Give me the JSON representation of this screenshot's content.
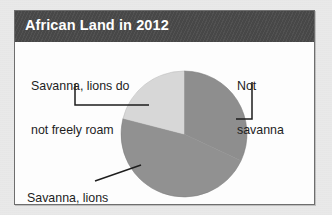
{
  "chart_data": {
    "type": "pie",
    "title": "African Land in 2012",
    "xlabel": "",
    "ylabel": "",
    "legend_position": "callout-labels",
    "grid": false,
    "categories": [
      "Not savanna",
      "Savanna, lions freely roam",
      "Savanna, lions do not freely roam"
    ],
    "values": [
      32,
      47,
      21
    ],
    "units": "percent of African land",
    "slices": [
      {
        "label": "Not savanna",
        "value": 32,
        "start_angle_deg": 0,
        "end_angle_deg": 115,
        "color": "#8e8e8e"
      },
      {
        "label": "Savanna, lions freely roam",
        "value": 47,
        "start_angle_deg": 115,
        "end_angle_deg": 284,
        "color": "#919191"
      },
      {
        "label": "Savanna, lions do not freely roam",
        "value": 21,
        "start_angle_deg": 284,
        "end_angle_deg": 360,
        "color": "#d7d7d7"
      }
    ]
  },
  "card": {
    "title": "African Land in 2012"
  },
  "labels": {
    "savanna_no_roam_line1": "Savanna, lions do",
    "savanna_no_roam_line2": "not freely roam",
    "not_savanna_line1": "Not",
    "not_savanna_line2": "savanna",
    "savanna_roam_line1": "Savanna, lions",
    "savanna_roam_line2": "freely roam"
  },
  "colors": {
    "title_bar": "#4a4a4a",
    "title_text": "#ffffff",
    "card_background": "#ffffff",
    "card_border": "#6e6e6e",
    "page_background": "#e9e9e9",
    "slice_not_savanna": "#8e8e8e",
    "slice_savanna_roam": "#919191",
    "slice_savanna_no_roam": "#d7d7d7",
    "leader_line": "#1d1d1d",
    "label_text": "#1d1d1d"
  }
}
